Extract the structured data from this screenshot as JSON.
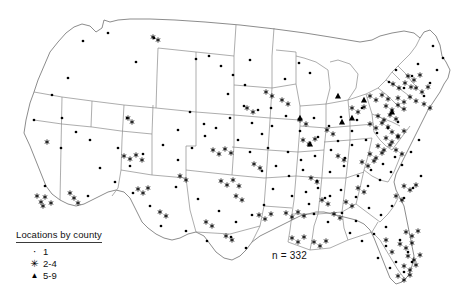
{
  "figure": {
    "type": "point-distribution-map",
    "region": "Contiguous United States",
    "sample_label": "n = 332"
  },
  "legend": {
    "title": "Locations by county",
    "items": [
      {
        "symbol": "dot-marker",
        "glyph": "·",
        "label": "1"
      },
      {
        "symbol": "asterisk-marker",
        "glyph": "✳",
        "label": "2-4"
      },
      {
        "symbol": "triangle-marker",
        "glyph": "▲",
        "label": "5-9"
      }
    ]
  },
  "colors": {
    "background": "#ffffff",
    "state_border": "#8a8a8a",
    "outline": "#6e6e6e",
    "marker": "#000000",
    "text": "#111111"
  },
  "chart_data": {
    "type": "scatter",
    "title": "",
    "xlabel": "",
    "ylabel": "",
    "annotation": "n = 332",
    "legend_position": "bottom-left",
    "grid": false,
    "categories": [
      "1",
      "2-4",
      "5-9"
    ],
    "series": [
      {
        "name": "1",
        "marker": "dot",
        "points": [
          [
            127,
            118
          ],
          [
            136,
            62
          ],
          [
            154,
            38
          ],
          [
            196,
            59
          ],
          [
            250,
            60
          ],
          [
            228,
            94
          ],
          [
            252,
            123
          ],
          [
            285,
            79
          ],
          [
            271,
            108
          ],
          [
            299,
            63
          ],
          [
            310,
            73
          ],
          [
            314,
            118
          ],
          [
            329,
            126
          ],
          [
            341,
            117
          ],
          [
            300,
            131
          ],
          [
            318,
            137
          ],
          [
            338,
            141
          ],
          [
            352,
            131
          ],
          [
            357,
            120
          ],
          [
            362,
            108
          ],
          [
            268,
            148
          ],
          [
            288,
            152
          ],
          [
            301,
            160
          ],
          [
            315,
            156
          ],
          [
            331,
            150
          ],
          [
            345,
            158
          ],
          [
            352,
            145
          ],
          [
            366,
            140
          ],
          [
            377,
            133
          ],
          [
            388,
            128
          ],
          [
            398,
            122
          ],
          [
            262,
            171
          ],
          [
            276,
            166
          ],
          [
            289,
            176
          ],
          [
            303,
            170
          ],
          [
            317,
            181
          ],
          [
            330,
            172
          ],
          [
            344,
            166
          ],
          [
            358,
            176
          ],
          [
            371,
            170
          ],
          [
            383,
            164
          ],
          [
            395,
            157
          ],
          [
            176,
            187
          ],
          [
            198,
            199
          ],
          [
            219,
            211
          ],
          [
            236,
            222
          ],
          [
            252,
            215
          ],
          [
            264,
            205
          ],
          [
            150,
            206
          ],
          [
            161,
            226
          ],
          [
            186,
            231
          ],
          [
            207,
            241
          ],
          [
            231,
            237
          ],
          [
            246,
            248
          ],
          [
            115,
            182
          ],
          [
            133,
            193
          ],
          [
            100,
            168
          ],
          [
            88,
            196
          ],
          [
            61,
            148
          ],
          [
            45,
            186
          ],
          [
            34,
            120
          ],
          [
            52,
            95
          ],
          [
            68,
            78
          ],
          [
            83,
            41
          ],
          [
            108,
            33
          ],
          [
            273,
            189
          ],
          [
            292,
            196
          ],
          [
            309,
            204
          ],
          [
            325,
            198
          ],
          [
            341,
            190
          ],
          [
            356,
            197
          ],
          [
            368,
            186
          ],
          [
            380,
            180
          ],
          [
            391,
            172
          ],
          [
            402,
            165
          ],
          [
            411,
            152
          ],
          [
            419,
            140
          ],
          [
            314,
            214
          ],
          [
            328,
            222
          ],
          [
            342,
            213
          ],
          [
            356,
            221
          ],
          [
            369,
            208
          ],
          [
            381,
            215
          ],
          [
            350,
            233
          ],
          [
            362,
            241
          ],
          [
            374,
            234
          ],
          [
            386,
            227
          ],
          [
            392,
            206
          ],
          [
            404,
            198
          ],
          [
            413,
            188
          ],
          [
            421,
            176
          ],
          [
            424,
            96
          ],
          [
            430,
            83
          ],
          [
            437,
            70
          ],
          [
            443,
            58
          ],
          [
            433,
            46
          ],
          [
            404,
            88
          ],
          [
            412,
            76
          ],
          [
            418,
            64
          ],
          [
            396,
            70
          ],
          [
            389,
            82
          ],
          [
            245,
            85
          ],
          [
            233,
            75
          ],
          [
            221,
            66
          ],
          [
            209,
            56
          ],
          [
            163,
            145
          ],
          [
            178,
            160
          ],
          [
            192,
            148
          ],
          [
            205,
            136
          ],
          [
            118,
            148
          ],
          [
            130,
            166
          ],
          [
            143,
            154
          ],
          [
            62,
            118
          ],
          [
            76,
            132
          ],
          [
            90,
            140
          ],
          [
            238,
            140
          ],
          [
            250,
            152
          ],
          [
            262,
            134
          ],
          [
            286,
            116
          ],
          [
            272,
            126
          ],
          [
            258,
            110
          ],
          [
            330,
            196
          ],
          [
            318,
            188
          ],
          [
            306,
            192
          ],
          [
            400,
            240
          ],
          [
            408,
            252
          ],
          [
            396,
            262
          ],
          [
            404,
            272
          ],
          [
            412,
            262
          ],
          [
            386,
            246
          ],
          [
            378,
            258
          ],
          [
            390,
            268
          ],
          [
            230,
            118
          ],
          [
            244,
            106
          ],
          [
            216,
            128
          ],
          [
            190,
            112
          ],
          [
            204,
            124
          ],
          [
            178,
            130
          ]
        ]
      },
      {
        "name": "2-4",
        "marker": "asterisk",
        "points": [
          [
            47,
            142
          ],
          [
            37,
            196
          ],
          [
            41,
            202
          ],
          [
            45,
            197
          ],
          [
            51,
            203
          ],
          [
            43,
            206
          ],
          [
            74,
            198
          ],
          [
            70,
            193
          ],
          [
            78,
            203
          ],
          [
            124,
            156
          ],
          [
            130,
            159
          ],
          [
            136,
            155
          ],
          [
            142,
            160
          ],
          [
            138,
            189
          ],
          [
            143,
            193
          ],
          [
            148,
            188
          ],
          [
            153,
            37
          ],
          [
            158,
            40
          ],
          [
            128,
            118
          ],
          [
            132,
            122
          ],
          [
            221,
            181
          ],
          [
            227,
            185
          ],
          [
            233,
            180
          ],
          [
            239,
            186
          ],
          [
            213,
            150
          ],
          [
            219,
            154
          ],
          [
            225,
            149
          ],
          [
            231,
            153
          ],
          [
            160,
            212
          ],
          [
            166,
            216
          ],
          [
            259,
            215
          ],
          [
            265,
            219
          ],
          [
            271,
            214
          ],
          [
            286,
            213
          ],
          [
            292,
            217
          ],
          [
            298,
            212
          ],
          [
            304,
            216
          ],
          [
            292,
            238
          ],
          [
            298,
            242
          ],
          [
            304,
            237
          ],
          [
            311,
            178
          ],
          [
            317,
            182
          ],
          [
            266,
            92
          ],
          [
            272,
            96
          ],
          [
            247,
            108
          ],
          [
            253,
            112
          ],
          [
            303,
            140
          ],
          [
            309,
            144
          ],
          [
            315,
            139
          ],
          [
            327,
            130
          ],
          [
            333,
            134
          ],
          [
            338,
            156
          ],
          [
            344,
            160
          ],
          [
            322,
            200
          ],
          [
            328,
            204
          ],
          [
            314,
            242
          ],
          [
            320,
            246
          ],
          [
            326,
            241
          ],
          [
            352,
            108
          ],
          [
            358,
            112
          ],
          [
            364,
            107
          ],
          [
            370,
            96
          ],
          [
            376,
            100
          ],
          [
            382,
            95
          ],
          [
            388,
            99
          ],
          [
            393,
            84
          ],
          [
            399,
            88
          ],
          [
            405,
            83
          ],
          [
            411,
            87
          ],
          [
            398,
            98
          ],
          [
            404,
            102
          ],
          [
            410,
            97
          ],
          [
            416,
            101
          ],
          [
            386,
            106
          ],
          [
            392,
            110
          ],
          [
            398,
            105
          ],
          [
            404,
            109
          ],
          [
            378,
            116
          ],
          [
            384,
            120
          ],
          [
            390,
            115
          ],
          [
            396,
            119
          ],
          [
            370,
            124
          ],
          [
            376,
            128
          ],
          [
            382,
            123
          ],
          [
            388,
            127
          ],
          [
            392,
            132
          ],
          [
            398,
            136
          ],
          [
            404,
            131
          ],
          [
            408,
            76
          ],
          [
            414,
            80
          ],
          [
            420,
            75
          ],
          [
            416,
            88
          ],
          [
            422,
            92
          ],
          [
            428,
            87
          ],
          [
            424,
            104
          ],
          [
            430,
            108
          ],
          [
            386,
            138
          ],
          [
            392,
            142
          ],
          [
            398,
            137
          ],
          [
            378,
            146
          ],
          [
            384,
            150
          ],
          [
            390,
            145
          ],
          [
            370,
            154
          ],
          [
            376,
            158
          ],
          [
            382,
            153
          ],
          [
            362,
            162
          ],
          [
            368,
            166
          ],
          [
            374,
            161
          ],
          [
            396,
            150
          ],
          [
            402,
            154
          ],
          [
            404,
            186
          ],
          [
            410,
            190
          ],
          [
            416,
            185
          ],
          [
            396,
            196
          ],
          [
            402,
            200
          ],
          [
            406,
            232
          ],
          [
            412,
            236
          ],
          [
            418,
            231
          ],
          [
            400,
            244
          ],
          [
            406,
            248
          ],
          [
            412,
            243
          ],
          [
            408,
            256
          ],
          [
            414,
            260
          ],
          [
            420,
            255
          ],
          [
            404,
            266
          ],
          [
            410,
            270
          ],
          [
            416,
            265
          ],
          [
            398,
            276
          ],
          [
            404,
            280
          ],
          [
            410,
            275
          ],
          [
            392,
            252
          ],
          [
            386,
            240
          ],
          [
            346,
            202
          ],
          [
            352,
            206
          ],
          [
            358,
            188
          ],
          [
            364,
            192
          ],
          [
            334,
            214
          ],
          [
            340,
            218
          ],
          [
            300,
            120
          ],
          [
            306,
            124
          ],
          [
            282,
            100
          ],
          [
            288,
            104
          ],
          [
            254,
            164
          ],
          [
            260,
            168
          ],
          [
            236,
            196
          ],
          [
            242,
            200
          ],
          [
            206,
            222
          ],
          [
            212,
            226
          ],
          [
            226,
            236
          ],
          [
            232,
            240
          ],
          [
            180,
            176
          ],
          [
            186,
            180
          ]
        ]
      },
      {
        "name": "5-9",
        "marker": "triangle",
        "points": [
          [
            300,
            118
          ],
          [
            342,
            122
          ],
          [
            352,
            118
          ],
          [
            310,
            144
          ],
          [
            364,
            100
          ],
          [
            392,
            112
          ],
          [
            338,
            96
          ]
        ]
      }
    ]
  }
}
